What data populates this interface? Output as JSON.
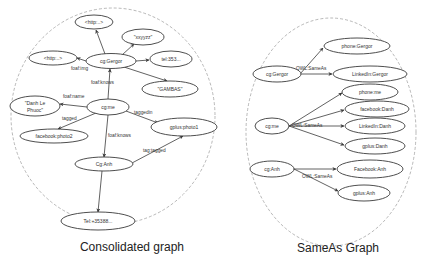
{
  "colors": {
    "node_stroke": "#3a3a3a",
    "frame_stroke": "#9a9a9a",
    "text": "#333333"
  },
  "consolidated": {
    "caption": "Consolidated graph",
    "nodes": {
      "http_top": "<http:..>",
      "xxyyzz": "\"xxyyzz\"",
      "http_left": "<http:..>",
      "gergor": "cg:Gergor",
      "tel353": "tel:353...",
      "gambas": "\"GAMBAS\"",
      "danh_line1": "\"Danh Le",
      "danh_line2": "Phuoc\"",
      "me": "cg:me",
      "gplus_photo1": "gplus:photo1",
      "facebook_photo2": "facebook:photo2",
      "anh": "Cg:Anh",
      "tel35388": "Tel:+35388..."
    },
    "edge_labels": {
      "foaf_img": "foaf:img",
      "foaf_knows_1": "foaf:knows",
      "foaf_name": "foaf:name",
      "tagged": "tagged",
      "taggedin": "taggedin",
      "foaf_knows_2": "foaf:knows",
      "tag_tagged": "tag:tagged"
    }
  },
  "sameas": {
    "caption": "SameAs Graph",
    "nodes": {
      "gergor": "cg:Gergor",
      "phone_gergor": "phone:Gergor",
      "linkedin_gergor": "LinkedIn:Gergor",
      "phone_me": "phone:me",
      "facebook_danh": "facebook:Danh",
      "me": "cg:me",
      "linkedin_danh": "LinkedIn:Danh",
      "gplus_danh": "gplus:Danh",
      "anh": "cg:Anh",
      "facebook_anh": "Facebook:Anh",
      "gplus_anh": "gplus:Anh"
    },
    "edge_labels": {
      "gergor_sameas": "OWL:SameAs",
      "me_sameas": "OWL:SameAs",
      "anh_sameas": "OWL:SameAs"
    }
  }
}
